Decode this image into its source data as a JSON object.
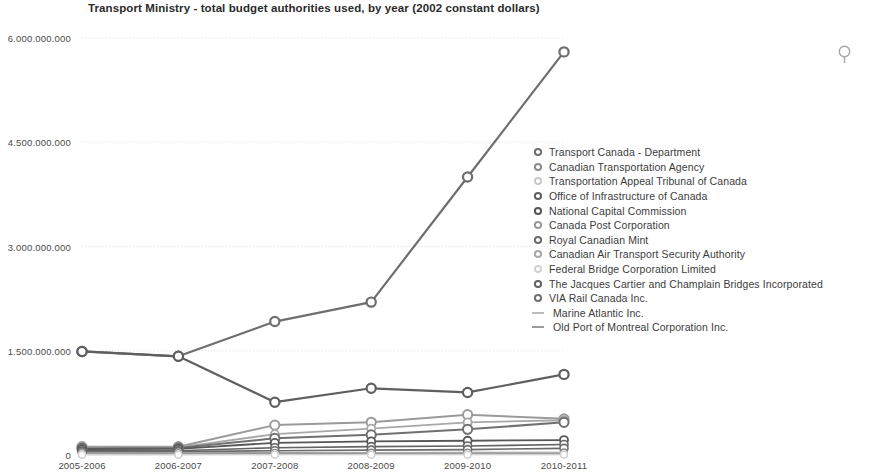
{
  "chart_title": "Transport Ministry - total budget authorities used, by year (2002 constant dollars)",
  "icons": {
    "magnifier": "search-icon"
  },
  "axes": {
    "y_ticks": [
      "6.000.000.000",
      "4.500.000.000",
      "3.000.000.000",
      "1.500.000.000",
      "0"
    ],
    "x_ticks": [
      "2005-2006",
      "2006-2007",
      "2007-2008",
      "2008-2009",
      "2009-2010",
      "2010-2011"
    ]
  },
  "legend": {
    "items": [
      {
        "label": "Transport Canada - Department",
        "marker": "circle",
        "color": "#6e6e6e"
      },
      {
        "label": "Canadian Transportation Agency",
        "marker": "circle",
        "color": "#8c8c8c"
      },
      {
        "label": "Transportation Appeal Tribunal of Canada",
        "marker": "circle",
        "color": "#c9c9c9"
      },
      {
        "label": "Office of Infrastructure of Canada",
        "marker": "circle",
        "color": "#5f5f5f"
      },
      {
        "label": "National Capital Commission",
        "marker": "circle",
        "color": "#565656"
      },
      {
        "label": "Canada Post Corporation",
        "marker": "circle",
        "color": "#9a9a9a"
      },
      {
        "label": "Royal Canadian Mint",
        "marker": "circle",
        "color": "#6b6b6b"
      },
      {
        "label": "Canadian Air Transport Security Authority",
        "marker": "circle",
        "color": "#a8a8a8"
      },
      {
        "label": "Federal Bridge Corporation Limited",
        "marker": "circle",
        "color": "#d2d2d2"
      },
      {
        "label": "The Jacques Cartier and Champlain Bridges Incorporated",
        "marker": "circle",
        "color": "#636363"
      },
      {
        "label": "VIA Rail Canada Inc.",
        "marker": "circle",
        "color": "#707070"
      },
      {
        "label": "Marine Atlantic Inc.",
        "marker": "dash",
        "color": "#b4b4b4"
      },
      {
        "label": "Old Port of Montreal Corporation Inc.",
        "marker": "dash",
        "color": "#8f8f8f"
      }
    ]
  },
  "chart_data": {
    "type": "line",
    "title": "Transport Ministry - total budget authorities used, by year (2002 constant dollars)",
    "xlabel": "",
    "ylabel": "",
    "categories": [
      "2005-2006",
      "2006-2007",
      "2007-2008",
      "2008-2009",
      "2009-2010",
      "2010-2011"
    ],
    "ylim": [
      0,
      6000000000
    ],
    "ytick_values": [
      6000000000,
      4500000000,
      3000000000,
      1500000000,
      0
    ],
    "grid": "horizontal",
    "legend_position": "right",
    "series": [
      {
        "name": "Transport Canada - Department",
        "color": "#6e6e6e",
        "marker": "circle",
        "width": 2.2,
        "values": [
          1490000000,
          1420000000,
          1920000000,
          2200000000,
          4000000000,
          5800000000
        ]
      },
      {
        "name": "Office of Infrastructure of Canada",
        "color": "#5f5f5f",
        "marker": "circle",
        "width": 2.2,
        "values": [
          1490000000,
          1420000000,
          760000000,
          960000000,
          900000000,
          1160000000
        ]
      },
      {
        "name": "Canada Post Corporation",
        "color": "#9a9a9a",
        "marker": "circle",
        "width": 2.0,
        "values": [
          120000000,
          120000000,
          430000000,
          470000000,
          580000000,
          520000000
        ]
      },
      {
        "name": "Canadian Air Transport Security Authority",
        "color": "#a8a8a8",
        "marker": "circle",
        "width": 1.8,
        "values": [
          105000000,
          108000000,
          300000000,
          380000000,
          470000000,
          500000000
        ]
      },
      {
        "name": "VIA Rail Canada Inc.",
        "color": "#707070",
        "marker": "circle",
        "width": 2.0,
        "values": [
          95000000,
          100000000,
          240000000,
          290000000,
          370000000,
          470000000
        ]
      },
      {
        "name": "National Capital Commission",
        "color": "#565656",
        "marker": "circle",
        "width": 1.8,
        "values": [
          85000000,
          88000000,
          175000000,
          195000000,
          205000000,
          215000000
        ]
      },
      {
        "name": "The Jacques Cartier and Champlain Bridges Incorporated",
        "color": "#636363",
        "marker": "circle",
        "width": 1.6,
        "values": [
          60000000,
          62000000,
          105000000,
          120000000,
          130000000,
          150000000
        ]
      },
      {
        "name": "Royal Canadian Mint",
        "color": "#6b6b6b",
        "marker": "circle",
        "width": 1.6,
        "values": [
          45000000,
          48000000,
          62000000,
          70000000,
          78000000,
          96000000
        ]
      },
      {
        "name": "Canadian Transportation Agency",
        "color": "#8c8c8c",
        "marker": "circle",
        "width": 1.4,
        "values": [
          28000000,
          29000000,
          32000000,
          34000000,
          36000000,
          38000000
        ]
      },
      {
        "name": "Marine Atlantic Inc.",
        "color": "#b4b4b4",
        "marker": "none",
        "width": 1.4,
        "values": [
          22000000,
          24000000,
          26000000,
          28000000,
          30000000,
          32000000
        ]
      },
      {
        "name": "Old Port of Montreal Corporation Inc.",
        "color": "#8f8f8f",
        "marker": "none",
        "width": 1.3,
        "values": [
          14000000,
          15000000,
          16000000,
          17000000,
          18000000,
          19000000
        ]
      },
      {
        "name": "Transportation Appeal Tribunal of Canada",
        "color": "#c9c9c9",
        "marker": "circle",
        "width": 1.2,
        "values": [
          6000000,
          6000000,
          7000000,
          7000000,
          8000000,
          8000000
        ]
      },
      {
        "name": "Federal Bridge Corporation Limited",
        "color": "#d2d2d2",
        "marker": "circle",
        "width": 1.2,
        "values": [
          4000000,
          4000000,
          5000000,
          5000000,
          6000000,
          6000000
        ]
      }
    ]
  }
}
